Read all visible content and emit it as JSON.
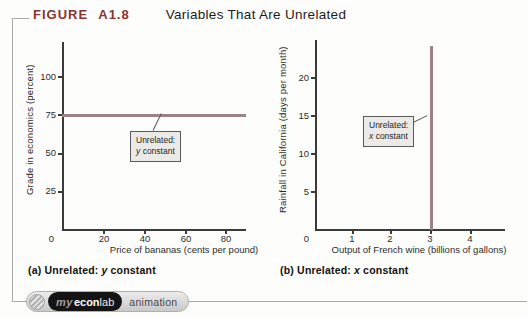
{
  "figure": {
    "label": "FIGURE A1.8",
    "title": "Variables That Are Unrelated"
  },
  "chart_data": [
    {
      "type": "line",
      "panel": "a",
      "title": "Unrelated: y constant",
      "xlabel": "Price of bananas (cents per pound)",
      "ylabel": "Grade in economics (percent)",
      "xlim": [
        0,
        90
      ],
      "ylim": [
        0,
        123
      ],
      "xticks": [
        0,
        20,
        40,
        60,
        80
      ],
      "yticks": [
        0,
        25,
        50,
        75,
        100
      ],
      "grid": false,
      "legend": "none",
      "annotation": {
        "line1": "Unrelated:",
        "var": "y",
        "rest": "constant"
      },
      "series": [
        {
          "name": "y constant at 75",
          "points": [
            [
              0,
              75
            ],
            [
              90,
              75
            ]
          ],
          "constant": {
            "axis": "y",
            "value": 75
          }
        }
      ]
    },
    {
      "type": "line",
      "panel": "b",
      "title": "Unrelated: x constant",
      "xlabel": "Output of French wine (billions of gallons)",
      "ylabel": "Rainfall in California (days per month)",
      "xlim": [
        0,
        5
      ],
      "ylim": [
        0,
        24
      ],
      "xticks": [
        0,
        1,
        2,
        3,
        4
      ],
      "yticks": [
        0,
        5,
        10,
        15,
        20
      ],
      "grid": false,
      "legend": "none",
      "annotation": {
        "line1": "Unrelated:",
        "var": "x",
        "rest": "constant"
      },
      "series": [
        {
          "name": "x constant at 3",
          "points": [
            [
              3,
              0
            ],
            [
              3,
              24
            ]
          ],
          "constant": {
            "axis": "x",
            "value": 3
          }
        }
      ]
    }
  ],
  "captions": {
    "a": {
      "prefix": "(a) Unrelated:",
      "var": "y",
      "rest": "constant"
    },
    "b": {
      "prefix": "(b) Unrelated:",
      "var": "x",
      "rest": "constant"
    }
  },
  "badge": {
    "my": "my",
    "econ": "econ",
    "lab": "lab",
    "animation": "animation"
  },
  "colors": {
    "figure_label_red": "#8a3330",
    "data_line": "#9c8486",
    "axis": "#3b3b3b",
    "callout_bg": "#eceae6",
    "border_grey": "#a8a8a8"
  }
}
